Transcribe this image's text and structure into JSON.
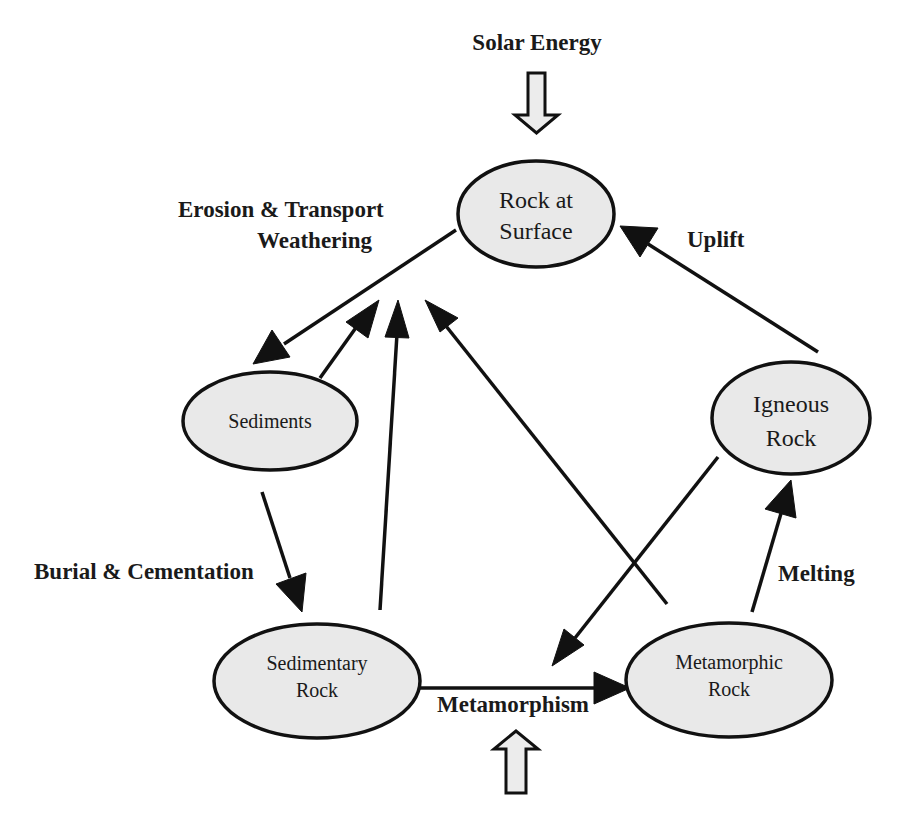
{
  "diagram": {
    "colors": {
      "node_fill": "#e9e9e9",
      "stroke": "#111111",
      "text": "#1a1a1a",
      "background": "#ffffff"
    },
    "inputs": {
      "solar_energy": "Solar Energy",
      "bottom_energy_label": ""
    },
    "nodes": {
      "rock_at_surface": {
        "line1": "Rock at",
        "line2": "Surface"
      },
      "sediments": {
        "line1": "Sediments"
      },
      "igneous_rock": {
        "line1": "Igneous",
        "line2": "Rock"
      },
      "sedimentary_rock": {
        "line1": "Sedimentary",
        "line2": "Rock"
      },
      "metamorphic_rock": {
        "line1": "Metamorphic",
        "line2": "Rock"
      }
    },
    "process_labels": {
      "erosion_transport": "Erosion & Transport",
      "weathering": "Weathering",
      "uplift": "Uplift",
      "burial_cementation": "Burial & Cementation",
      "melting": "Melting",
      "metamorphism": "Metamorphism"
    },
    "edges": [
      {
        "from": "Rock at Surface",
        "to": "Sediments",
        "process": "Erosion & Transport"
      },
      {
        "from": "Sediments",
        "to": "Weathering (center)",
        "process": "Weathering"
      },
      {
        "from": "Sedimentary Rock",
        "to": "Weathering (center)",
        "process": "Weathering"
      },
      {
        "from": "Metamorphic Rock",
        "to": "Weathering (center)",
        "process": "Weathering"
      },
      {
        "from": "Igneous Rock",
        "to": "Rock at Surface",
        "process": "Uplift"
      },
      {
        "from": "Sediments",
        "to": "Sedimentary Rock",
        "process": "Burial & Cementation"
      },
      {
        "from": "Sedimentary Rock",
        "to": "Metamorphic Rock",
        "process": "Metamorphism"
      },
      {
        "from": "Metamorphic Rock",
        "to": "Igneous Rock",
        "process": "Melting"
      },
      {
        "from": "Igneous Rock",
        "to": "Sedimentary Rock",
        "process": ""
      }
    ]
  }
}
